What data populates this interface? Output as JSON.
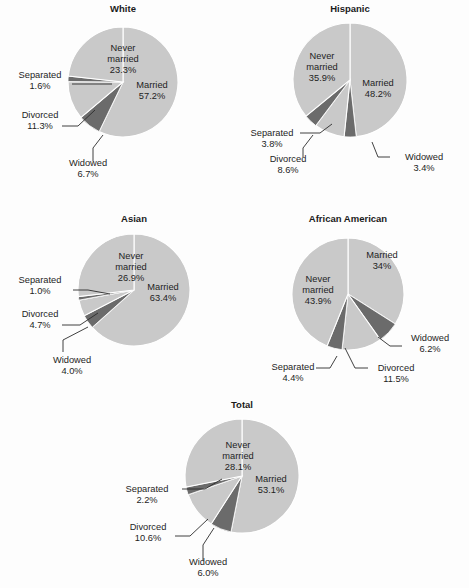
{
  "figure": {
    "background": "#fdfdfd",
    "light_slice_color": "#c9c9c9",
    "dark_slice_color": "#6b6b6b",
    "separator_color": "#ffffff",
    "text_color": "#1e1e1e"
  },
  "chart_data": [
    {
      "type": "pie",
      "title": "White",
      "categories": [
        "Married",
        "Widowed",
        "Divorced",
        "Separated",
        "Never married"
      ],
      "values": [
        57.2,
        6.7,
        11.3,
        1.6,
        23.3
      ],
      "labels": [
        {
          "name": "Married",
          "value": "57.2%",
          "text1": "Married",
          "text2": "57.2%"
        },
        {
          "name": "Widowed",
          "value": "6.7%",
          "text1": "Widowed",
          "text2": "6.7%"
        },
        {
          "name": "Divorced",
          "value": "11.3%",
          "text1": "Divorced",
          "text2": "11.3%"
        },
        {
          "name": "Separated",
          "value": "1.6%",
          "text1": "Separated",
          "text2": "1.6%"
        },
        {
          "name": "Never married",
          "value": "23.3%",
          "text1": "Never",
          "text2": "married",
          "text3": "23.3%"
        }
      ],
      "center": [
        123,
        82
      ],
      "radius": 55,
      "title_pos": [
        123,
        12
      ]
    },
    {
      "type": "pie",
      "title": "Hispanic",
      "categories": [
        "Married",
        "Widowed",
        "Divorced",
        "Separated",
        "Never married"
      ],
      "values": [
        48.2,
        3.4,
        8.6,
        3.8,
        35.9
      ],
      "labels": [
        {
          "name": "Married",
          "value": "48.2%",
          "text1": "Married",
          "text2": "48.2%"
        },
        {
          "name": "Widowed",
          "value": "3.4%",
          "text1": "Widowed",
          "text2": "3.4%"
        },
        {
          "name": "Divorced",
          "value": "8.6%",
          "text1": "Divorced",
          "text2": "8.6%"
        },
        {
          "name": "Separated",
          "value": "3.8%",
          "text1": "Separated",
          "text2": "3.8%"
        },
        {
          "name": "Never married",
          "value": "35.9%",
          "text1": "Never",
          "text2": "married",
          "text3": "35.9%"
        }
      ],
      "center": [
        350,
        80
      ],
      "radius": 57,
      "title_pos": [
        350,
        12
      ]
    },
    {
      "type": "pie",
      "title": "Asian",
      "categories": [
        "Married",
        "Widowed",
        "Divorced",
        "Separated",
        "Never married"
      ],
      "values": [
        63.4,
        4.0,
        4.7,
        1.0,
        26.9
      ],
      "labels": [
        {
          "name": "Married",
          "value": "63.4%",
          "text1": "Married",
          "text2": "63.4%"
        },
        {
          "name": "Widowed",
          "value": "4.0%",
          "text1": "Widowed",
          "text2": "4.0%"
        },
        {
          "name": "Divorced",
          "value": "4.7%",
          "text1": "Divorced",
          "text2": "4.7%"
        },
        {
          "name": "Separated",
          "value": "1.0%",
          "text1": "Separated",
          "text2": "1.0%"
        },
        {
          "name": "Never married",
          "value": "26.9%",
          "text1": "Never",
          "text2": "married",
          "text3": "26.9%"
        }
      ],
      "center": [
        134,
        290
      ],
      "radius": 56,
      "title_pos": [
        134,
        222
      ]
    },
    {
      "type": "pie",
      "title": "African American",
      "categories": [
        "Married",
        "Widowed",
        "Divorced",
        "Separated",
        "Never married"
      ],
      "values": [
        34.0,
        6.2,
        11.5,
        4.4,
        43.9
      ],
      "labels": [
        {
          "name": "Married",
          "value": "34%",
          "text1": "Married",
          "text2": "34%"
        },
        {
          "name": "Widowed",
          "value": "6.2%",
          "text1": "Widowed",
          "text2": "6.2%"
        },
        {
          "name": "Divorced",
          "value": "11.5%",
          "text1": "Divorced",
          "text2": "11.5%"
        },
        {
          "name": "Separated",
          "value": "4.4%",
          "text1": "Separated",
          "text2": "4.4%"
        },
        {
          "name": "Never married",
          "value": "43.9%",
          "text1": "Never",
          "text2": "married",
          "text3": "43.9%"
        }
      ],
      "center": [
        348,
        294
      ],
      "radius": 56,
      "title_pos": [
        348,
        222
      ]
    },
    {
      "type": "pie",
      "title": "Total",
      "categories": [
        "Married",
        "Widowed",
        "Divorced",
        "Separated",
        "Never married"
      ],
      "values": [
        53.1,
        6.0,
        10.6,
        2.2,
        28.1
      ],
      "labels": [
        {
          "name": "Married",
          "value": "53.1%",
          "text1": "Married",
          "text2": "53.1%"
        },
        {
          "name": "Widowed",
          "value": "6.0%",
          "text1": "Widowed",
          "text2": "6.0%"
        },
        {
          "name": "Divorced",
          "value": "10.6%",
          "text1": "Divorced",
          "text2": "10.6%"
        },
        {
          "name": "Separated",
          "value": "2.2%",
          "text1": "Separated",
          "text2": "2.2%"
        },
        {
          "name": "Never married",
          "value": "28.1%",
          "text1": "Never",
          "text2": "married",
          "text3": "28.1%"
        }
      ],
      "center": [
        242,
        476
      ],
      "radius": 57,
      "title_pos": [
        242,
        408
      ]
    }
  ],
  "annotations": {
    "white": {
      "married": [
        152,
        88,
        152,
        99
      ],
      "never": [
        123,
        51,
        123,
        62,
        123,
        73
      ],
      "separated": [
        40,
        78,
        40,
        89
      ],
      "divorced": [
        40,
        118,
        40,
        129
      ],
      "widowed": [
        88,
        166,
        88,
        177
      ],
      "sep_leader": "M 72,84 L 112,84",
      "div_leader": "M 62,126 L 78,126 L 95,110",
      "wid_leader": "M 93,161 L 93,148 L 103,135"
    },
    "hispanic": {
      "married": [
        378,
        86,
        378,
        97
      ],
      "never": [
        322,
        59,
        322,
        70,
        322,
        81
      ],
      "separated": [
        272,
        136,
        272,
        147
      ],
      "divorced": [
        288,
        162,
        288,
        173
      ],
      "widowed": [
        424,
        160,
        424,
        171
      ],
      "sep_leader": "M 300,133 L 320,133 L 332,124",
      "div_leader": "M 303,157 L 303,148 L 313,135",
      "wid_leader": "M 390,157 L 378,157 L 372,142"
    },
    "asian": {
      "married": [
        163,
        290,
        163,
        301
      ],
      "never": [
        131,
        259,
        131,
        270,
        131,
        281
      ],
      "separated": [
        40,
        283,
        40,
        294
      ],
      "divorced": [
        40,
        317,
        40,
        328
      ],
      "widowed": [
        72,
        363,
        72,
        374
      ],
      "sep_leader": "M 73,290 L 88,290 L 110,294",
      "div_leader": "M 62,325 L 80,325 L 98,313",
      "wid_leader": "M 63,352 L 63,340 L 88,327"
    },
    "african_american": {
      "married": [
        382,
        258,
        382,
        269
      ],
      "never": [
        318,
        282,
        318,
        293,
        318,
        304
      ],
      "separated": [
        293,
        370,
        293,
        381
      ],
      "divorced": [
        396,
        371,
        396,
        382
      ],
      "widowed": [
        430,
        341,
        430,
        352
      ],
      "sep_leader": "M 316,368 L 330,368 L 337,356",
      "div_leader": "M 368,368 L 355,368 L 345,348",
      "wid_leader": "M 402,346 L 390,346 L 378,337"
    },
    "total": {
      "married": [
        271,
        482,
        271,
        493
      ],
      "never": [
        238,
        448,
        238,
        459,
        238,
        470
      ],
      "separated": [
        147,
        492,
        147,
        503
      ],
      "divorced": [
        148,
        530,
        148,
        541
      ],
      "widowed": [
        208,
        565,
        208,
        576
      ],
      "sep_leader": "M 182,489 L 205,489 L 222,479",
      "div_leader": "M 175,536 L 190,536 L 208,519",
      "wid_leader": "M 203,561 L 203,545 L 214,528"
    }
  }
}
